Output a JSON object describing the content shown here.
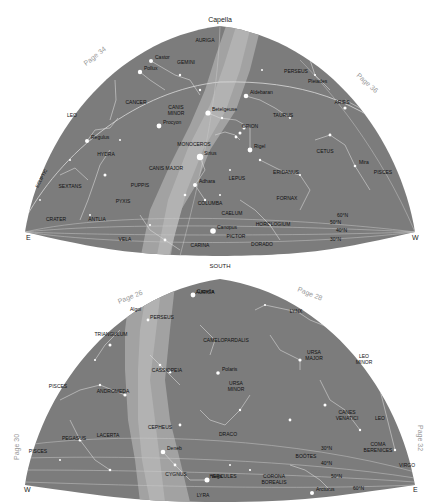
{
  "colors": {
    "sky": "#7c7c7c",
    "milky_way": "#a4a4a4",
    "milky_way_core": "#b6b6b6",
    "star": "#ffffff",
    "label": "#111111",
    "page_ref": "#9a9a9a"
  },
  "top_map": {
    "title": "Capella",
    "bottom_label": "SOUTH",
    "left_dir": "E",
    "right_dir": "W",
    "page_left": "Page 34",
    "page_right": "Page 36",
    "ecliptic_label": "ECLIPTIC",
    "constellations": [
      {
        "name": "AURIGA",
        "x": 205,
        "y": 42
      },
      {
        "name": "GEMINI",
        "x": 186,
        "y": 64
      },
      {
        "name": "PERSEUS",
        "x": 296,
        "y": 73
      },
      {
        "name": "CANCER",
        "x": 136,
        "y": 104
      },
      {
        "name": "CANIS",
        "x": 176,
        "y": 109
      },
      {
        "name": "MINOR",
        "x": 176,
        "y": 115
      },
      {
        "name": "LEO",
        "x": 72,
        "y": 117
      },
      {
        "name": "TAURUS",
        "x": 283,
        "y": 117
      },
      {
        "name": "ARIES",
        "x": 342,
        "y": 104
      },
      {
        "name": "ORION",
        "x": 250,
        "y": 128
      },
      {
        "name": "HYDRA",
        "x": 106,
        "y": 156
      },
      {
        "name": "MONOCEROS",
        "x": 194,
        "y": 146
      },
      {
        "name": "CETUS",
        "x": 325,
        "y": 153
      },
      {
        "name": "CANIS MAJOR",
        "x": 166,
        "y": 170
      },
      {
        "name": "LEPUS",
        "x": 237,
        "y": 180
      },
      {
        "name": "ERIDANUS",
        "x": 286,
        "y": 174
      },
      {
        "name": "PISCES",
        "x": 383,
        "y": 174
      },
      {
        "name": "SEXTANS",
        "x": 70,
        "y": 188
      },
      {
        "name": "PUPPIS",
        "x": 140,
        "y": 187
      },
      {
        "name": "PYXIS",
        "x": 123,
        "y": 203
      },
      {
        "name": "COLUMBA",
        "x": 210,
        "y": 205
      },
      {
        "name": "FORNAX",
        "x": 287,
        "y": 200
      },
      {
        "name": "CRATER",
        "x": 56,
        "y": 221
      },
      {
        "name": "ANTLIA",
        "x": 97,
        "y": 221
      },
      {
        "name": "CAELUM",
        "x": 232,
        "y": 215
      },
      {
        "name": "HOROLOGIUM",
        "x": 273,
        "y": 226
      },
      {
        "name": "VELA",
        "x": 125,
        "y": 241
      },
      {
        "name": "PICTOR",
        "x": 236,
        "y": 238
      },
      {
        "name": "CARINA",
        "x": 200,
        "y": 247
      },
      {
        "name": "DORADO",
        "x": 262,
        "y": 246
      }
    ],
    "stars": [
      {
        "name": "Castor",
        "x": 151,
        "y": 61
      },
      {
        "name": "Pollux",
        "x": 140,
        "y": 72
      },
      {
        "name": "Aldebaran",
        "x": 246,
        "y": 96
      },
      {
        "name": "Pleiades",
        "x": 304,
        "y": 85
      },
      {
        "name": "Betelgeuse",
        "x": 208,
        "y": 113
      },
      {
        "name": "Procyon",
        "x": 159,
        "y": 126
      },
      {
        "name": "Regulus",
        "x": 87,
        "y": 141
      },
      {
        "name": "Rigel",
        "x": 250,
        "y": 150
      },
      {
        "name": "Sirius",
        "x": 200,
        "y": 157
      },
      {
        "name": "Adhara",
        "x": 195,
        "y": 185
      },
      {
        "name": "Canopus",
        "x": 213,
        "y": 231
      },
      {
        "name": "Mira",
        "x": 355,
        "y": 166
      }
    ],
    "latitudes": [
      "60°N",
      "50°N",
      "40°N",
      "30°N"
    ]
  },
  "bottom_map": {
    "left_dir": "W",
    "right_dir": "E",
    "page_top_left": "Page 26",
    "page_top_right": "Page 28",
    "page_left": "Page 30",
    "page_right": "Page 32",
    "constellations": [
      {
        "name": "AURIGA",
        "x": 205,
        "y": 294
      },
      {
        "name": "PERSEUS",
        "x": 162,
        "y": 319
      },
      {
        "name": "LYNX",
        "x": 296,
        "y": 313
      },
      {
        "name": "TRIANGULUM",
        "x": 111,
        "y": 336
      },
      {
        "name": "CAMELOPARDALIS",
        "x": 226,
        "y": 342
      },
      {
        "name": "URSA",
        "x": 314,
        "y": 354
      },
      {
        "name": "MAJOR",
        "x": 314,
        "y": 360
      },
      {
        "name": "LEO",
        "x": 364,
        "y": 358
      },
      {
        "name": "MINOR",
        "x": 364,
        "y": 364
      },
      {
        "name": "PISCES",
        "x": 58,
        "y": 388
      },
      {
        "name": "CASSIOPEIA",
        "x": 167,
        "y": 372
      },
      {
        "name": "URSA",
        "x": 236,
        "y": 385
      },
      {
        "name": "MINOR",
        "x": 236,
        "y": 391
      },
      {
        "name": "ANDROMEDA",
        "x": 113,
        "y": 393
      },
      {
        "name": "CANES",
        "x": 347,
        "y": 414
      },
      {
        "name": "VENATICI",
        "x": 347,
        "y": 420
      },
      {
        "name": "LEO",
        "x": 380,
        "y": 420
      },
      {
        "name": "CEPHEUS",
        "x": 160,
        "y": 429
      },
      {
        "name": "PEGASUS",
        "x": 74,
        "y": 440
      },
      {
        "name": "LACERTA",
        "x": 108,
        "y": 437
      },
      {
        "name": "DRACO",
        "x": 228,
        "y": 436
      },
      {
        "name": "COMA",
        "x": 378,
        "y": 446
      },
      {
        "name": "BERENICES",
        "x": 378,
        "y": 452
      },
      {
        "name": "PISCES",
        "x": 38,
        "y": 453
      },
      {
        "name": "BOÖTES",
        "x": 306,
        "y": 458
      },
      {
        "name": "VIRGO",
        "x": 407,
        "y": 467
      },
      {
        "name": "CYGNUS",
        "x": 176,
        "y": 476
      },
      {
        "name": "HERCULES",
        "x": 223,
        "y": 478
      },
      {
        "name": "CORONA",
        "x": 274,
        "y": 478
      },
      {
        "name": "BOREALIS",
        "x": 274,
        "y": 484
      },
      {
        "name": "LYRA",
        "x": 203,
        "y": 497
      }
    ],
    "stars": [
      {
        "name": "Capella",
        "x": 193,
        "y": 295
      },
      {
        "name": "Algol",
        "x": 126,
        "y": 313
      },
      {
        "name": "Polaris",
        "x": 218,
        "y": 373
      },
      {
        "name": "Deneb",
        "x": 163,
        "y": 452
      },
      {
        "name": "Vega",
        "x": 207,
        "y": 480
      },
      {
        "name": "Arcturus",
        "x": 312,
        "y": 493
      }
    ],
    "latitudes": [
      "30°N",
      "40°N",
      "50°N",
      "60°N"
    ]
  }
}
